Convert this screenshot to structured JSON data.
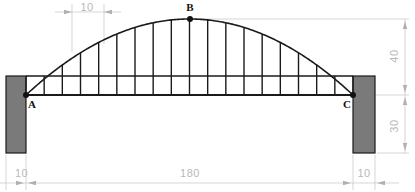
{
  "drawing": {
    "title": "Parabolic arch bridge elevation",
    "type": "engineering-elevation",
    "units": "unitless",
    "line_color": "#1a1a1a",
    "dimension_color": "#b9b9b9",
    "abutment_fill": "#7a7a7a",
    "abutment_stroke": "#1a1a1a",
    "background": "#ffffff"
  },
  "nodes": [
    {
      "id": "A",
      "label": "A",
      "x": 26,
      "y": 95,
      "label_x": 32,
      "label_y": 108,
      "marker": true
    },
    {
      "id": "B",
      "label": "B",
      "x": 190,
      "y": 19,
      "label_x": 190,
      "label_y": 11,
      "marker": true
    },
    {
      "id": "C",
      "label": "C",
      "x": 353,
      "y": 95,
      "label_x": 347,
      "label_y": 108,
      "marker": true
    }
  ],
  "dimensions": [
    {
      "id": "panel-spacing",
      "value": "10",
      "orientation": "horizontal",
      "text_x": 87,
      "text_y": 11
    },
    {
      "id": "arch-rise",
      "value": "40",
      "orientation": "vertical",
      "text_x": 398,
      "text_y": 56
    },
    {
      "id": "pier-height",
      "value": "30",
      "orientation": "vertical",
      "text_x": 398,
      "text_y": 126
    },
    {
      "id": "span",
      "value": "180",
      "orientation": "horizontal",
      "text_x": 190,
      "text_y": 177
    },
    {
      "id": "left-pier-width",
      "value": "10",
      "orientation": "horizontal",
      "text_x": 15,
      "text_y": 177
    },
    {
      "id": "right-pier-width",
      "value": "10",
      "orientation": "horizontal",
      "text_x": 364,
      "text_y": 177
    }
  ],
  "structure": {
    "span_start_x": 26,
    "span_end_x": 353,
    "deck_y": 76,
    "lower_chord_y": 95,
    "apex_y": 19,
    "bays": 18,
    "abutments": [
      {
        "id": "left-abutment",
        "x": 6,
        "y": 76,
        "w": 20,
        "h": 77
      },
      {
        "id": "right-abutment",
        "x": 353,
        "y": 76,
        "w": 22,
        "h": 77
      }
    ]
  },
  "chart_data": {
    "type": "line",
    "xlabel": "",
    "ylabel": "",
    "xlim": [
      0,
      180
    ],
    "ylim": [
      -30,
      40
    ],
    "grid": false,
    "annotations": [
      "A",
      "B",
      "C",
      "10",
      "40",
      "30",
      "180",
      "10",
      "10"
    ],
    "series": [
      {
        "name": "arch (parabola)",
        "x": [
          0,
          10,
          20,
          30,
          40,
          50,
          60,
          70,
          80,
          90,
          100,
          110,
          120,
          130,
          140,
          150,
          160,
          170,
          180
        ],
        "values": [
          0,
          8.4,
          15.8,
          22.2,
          27.7,
          32.1,
          35.6,
          38.0,
          39.5,
          40.0,
          39.5,
          38.0,
          35.6,
          32.1,
          27.7,
          22.2,
          15.8,
          8.4,
          0
        ]
      },
      {
        "name": "deck (upper chord)",
        "x": [
          0,
          180
        ],
        "values": [
          10.4,
          10.4
        ]
      },
      {
        "name": "lower chord",
        "x": [
          0,
          180
        ],
        "values": [
          0,
          0
        ]
      }
    ],
    "key_points": [
      {
        "label": "A",
        "x": 0,
        "y": 0
      },
      {
        "label": "B",
        "x": 90,
        "y": 40
      },
      {
        "label": "C",
        "x": 180,
        "y": 0
      }
    ]
  }
}
